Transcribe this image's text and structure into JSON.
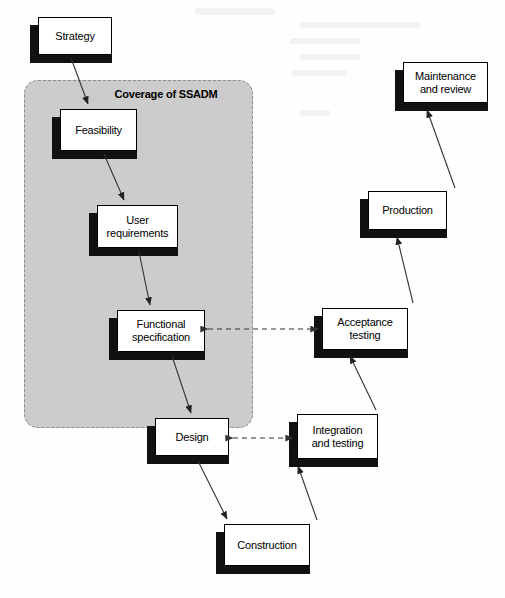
{
  "diagram": {
    "title": "Coverage of SSADM",
    "region_label": "Coverage of SSADM",
    "colors": {
      "region_fill": "#cccccc",
      "region_border": "#8c8c8c",
      "node_fill": "#ffffff",
      "node_border": "#000000",
      "shadow": "#111111",
      "arrow": "#333333",
      "dashed_arrow": "#555555",
      "page_background": "#fefefe"
    },
    "nodes": [
      {
        "id": "strategy",
        "label": "Strategy",
        "x": 38,
        "y": 17,
        "w": 74,
        "h": 38,
        "in_region": false
      },
      {
        "id": "feasibility",
        "label": "Feasibility",
        "x": 60,
        "y": 109,
        "w": 77,
        "h": 42,
        "in_region": true
      },
      {
        "id": "user-req",
        "label": "User\nrequirements",
        "x": 97,
        "y": 205,
        "w": 81,
        "h": 43,
        "in_region": true
      },
      {
        "id": "func-spec",
        "label": "Functional\nspecification",
        "x": 117,
        "y": 310,
        "w": 88,
        "h": 42,
        "in_region": true
      },
      {
        "id": "design",
        "label": "Design",
        "x": 155,
        "y": 418,
        "w": 74,
        "h": 38,
        "in_region": true
      },
      {
        "id": "construction",
        "label": "Construction",
        "x": 224,
        "y": 524,
        "w": 86,
        "h": 42,
        "in_region": false
      },
      {
        "id": "integration",
        "label": "Integration\nand testing",
        "x": 297,
        "y": 414,
        "w": 81,
        "h": 45,
        "in_region": false
      },
      {
        "id": "acceptance",
        "label": "Acceptance\ntesting",
        "x": 322,
        "y": 308,
        "w": 86,
        "h": 42,
        "in_region": false
      },
      {
        "id": "production",
        "label": "Production",
        "x": 368,
        "y": 191,
        "w": 79,
        "h": 39,
        "in_region": false
      },
      {
        "id": "maintenance",
        "label": "Maintenance\nand review",
        "x": 403,
        "y": 62,
        "w": 85,
        "h": 41,
        "in_region": false
      }
    ],
    "edges": [
      {
        "id": "strategy-to-feasibility",
        "from": "strategy",
        "to": "feasibility",
        "style": "solid",
        "direction": "one-way"
      },
      {
        "id": "feasibility-to-user-req",
        "from": "feasibility",
        "to": "user-req",
        "style": "solid",
        "direction": "one-way"
      },
      {
        "id": "user-req-to-func-spec",
        "from": "user-req",
        "to": "func-spec",
        "style": "solid",
        "direction": "one-way"
      },
      {
        "id": "func-spec-to-design",
        "from": "func-spec",
        "to": "design",
        "style": "solid",
        "direction": "one-way"
      },
      {
        "id": "design-to-construction",
        "from": "design",
        "to": "construction",
        "style": "solid",
        "direction": "one-way"
      },
      {
        "id": "construction-to-integration",
        "from": "construction",
        "to": "integration",
        "style": "solid",
        "direction": "one-way"
      },
      {
        "id": "integration-to-acceptance",
        "from": "integration",
        "to": "acceptance",
        "style": "solid",
        "direction": "one-way"
      },
      {
        "id": "acceptance-to-production",
        "from": "acceptance",
        "to": "production",
        "style": "solid",
        "direction": "one-way"
      },
      {
        "id": "production-to-maintenance",
        "from": "production",
        "to": "maintenance",
        "style": "solid",
        "direction": "one-way"
      },
      {
        "id": "func-spec-acceptance-link",
        "from": "func-spec",
        "to": "acceptance",
        "style": "dashed",
        "direction": "two-way"
      },
      {
        "id": "design-integration-link",
        "from": "design",
        "to": "integration",
        "style": "dashed",
        "direction": "two-way"
      }
    ]
  }
}
